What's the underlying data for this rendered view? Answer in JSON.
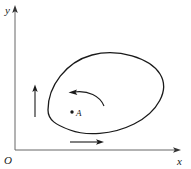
{
  "figure": {
    "background_color": "#ffffff",
    "ink_color": "#1a1a1a",
    "width": 191,
    "height": 169
  },
  "axes": {
    "origin_label": "O",
    "x_axis_label": "x",
    "y_axis_label": "y",
    "x_axis": {
      "from_x": 15,
      "to_x": 180,
      "y": 150,
      "arrow": "right"
    },
    "y_axis": {
      "x": 15,
      "from_y": 150,
      "to_y": 8,
      "arrow": "up"
    },
    "color": "#555555"
  },
  "curve": {
    "name": "closed-oval-curve",
    "type": "closed smooth curve",
    "stroke_color": "#1a1a1a",
    "stroke_width": 1.3,
    "fill": "none",
    "bounds": {
      "left": 48,
      "right": 163,
      "top": 52,
      "bottom": 134
    },
    "path": "M 48 110 C 48 86 66 62 92 55 C 118 48 150 58 160 74 C 170 90 158 112 134 124 C 112 135 86 136 70 130 C 56 125 48 120 48 110 Z"
  },
  "point": {
    "name": "A",
    "label": "A",
    "dot_x": 72,
    "dot_y": 112,
    "dot_radius": 1.6,
    "label_x": 76,
    "label_y": 116
  },
  "arrows": {
    "circulation": {
      "name": "curved-circulation-arrow",
      "description": "counterclockwise curved arrow above point A",
      "path": "M 104 106 C 100 96 88 90 73 92",
      "head_at": {
        "x": 70,
        "y": 92
      },
      "direction": "left"
    },
    "vertical": {
      "name": "vertical-up-arrow",
      "description": "short vertical arrow pointing up at left of curve",
      "x": 35,
      "from_y": 117,
      "to_y": 86,
      "direction": "up"
    },
    "horizontal": {
      "name": "horizontal-right-arrow",
      "description": "short horizontal arrow pointing right below curve",
      "y": 142,
      "from_x": 70,
      "to_x": 104,
      "direction": "right"
    }
  }
}
